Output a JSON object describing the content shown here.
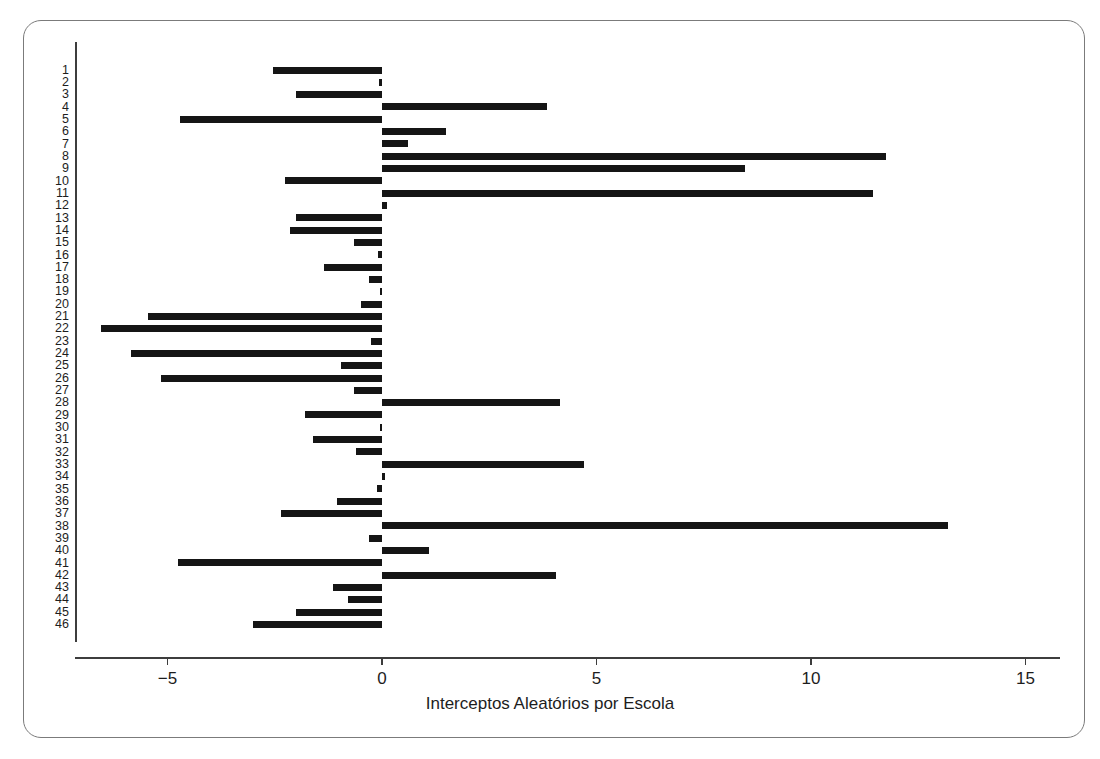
{
  "figure": {
    "frame_color": "#7b7b7b",
    "bar_color": "#151515",
    "axis_color": "#3d3d3d"
  },
  "chart_data": {
    "type": "bar",
    "orientation": "horizontal",
    "title": "",
    "xlabel": "Interceptos Aleatórios por Escola",
    "ylabel": "",
    "xlim": [
      -7.2,
      15.9
    ],
    "ylim": [
      0.5,
      46.5
    ],
    "grid": false,
    "legend": null,
    "xticks": [
      -5,
      0,
      5,
      10,
      15
    ],
    "xticklabels": [
      "−5",
      "0",
      "5",
      "10",
      "15"
    ],
    "categories": [
      "1",
      "2",
      "3",
      "4",
      "5",
      "6",
      "7",
      "8",
      "9",
      "10",
      "11",
      "12",
      "13",
      "14",
      "15",
      "16",
      "17",
      "18",
      "19",
      "20",
      "21",
      "22",
      "23",
      "24",
      "25",
      "26",
      "27",
      "28",
      "29",
      "30",
      "31",
      "32",
      "33",
      "34",
      "35",
      "36",
      "37",
      "38",
      "39",
      "40",
      "41",
      "42",
      "43",
      "44",
      "45",
      "46"
    ],
    "values": [
      -2.55,
      -0.08,
      -2.0,
      3.85,
      -4.7,
      1.5,
      0.6,
      11.75,
      8.45,
      -2.25,
      11.45,
      0.12,
      -2.0,
      -2.15,
      -0.65,
      -0.1,
      -1.35,
      -0.3,
      -0.05,
      -0.5,
      -5.45,
      -6.55,
      -0.25,
      -5.85,
      -0.95,
      -5.15,
      -0.65,
      4.15,
      -1.8,
      -0.05,
      -1.6,
      -0.6,
      4.7,
      0.06,
      -0.12,
      -1.05,
      -2.35,
      13.2,
      -0.3,
      1.1,
      -4.75,
      4.05,
      -1.15,
      -0.8,
      -2.0,
      -3.0
    ]
  }
}
